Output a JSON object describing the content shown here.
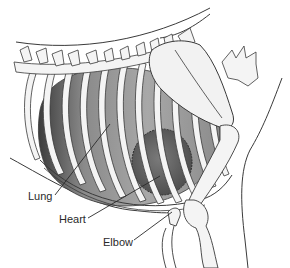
{
  "diagram": {
    "labels": [
      {
        "id": "lung",
        "text": "Lung",
        "x": 28,
        "y": 190,
        "leader": {
          "x1": 55,
          "y1": 195,
          "x2": 110,
          "y2": 124
        }
      },
      {
        "id": "heart",
        "text": "Heart",
        "x": 59,
        "y": 213,
        "leader": {
          "x1": 88,
          "y1": 218,
          "x2": 160,
          "y2": 176
        }
      },
      {
        "id": "elbow",
        "text": "Elbow",
        "x": 103,
        "y": 236,
        "leader": {
          "x1": 134,
          "y1": 240,
          "x2": 172,
          "y2": 212
        }
      }
    ],
    "colors": {
      "outline": "#3a3a3a",
      "bone_fill": "#f2f2f2",
      "lung_shade": "#9a9a9a",
      "lung_dark": "#4a4a4a",
      "heart_fill": "#6e6e6e",
      "background": "#ffffff"
    }
  }
}
